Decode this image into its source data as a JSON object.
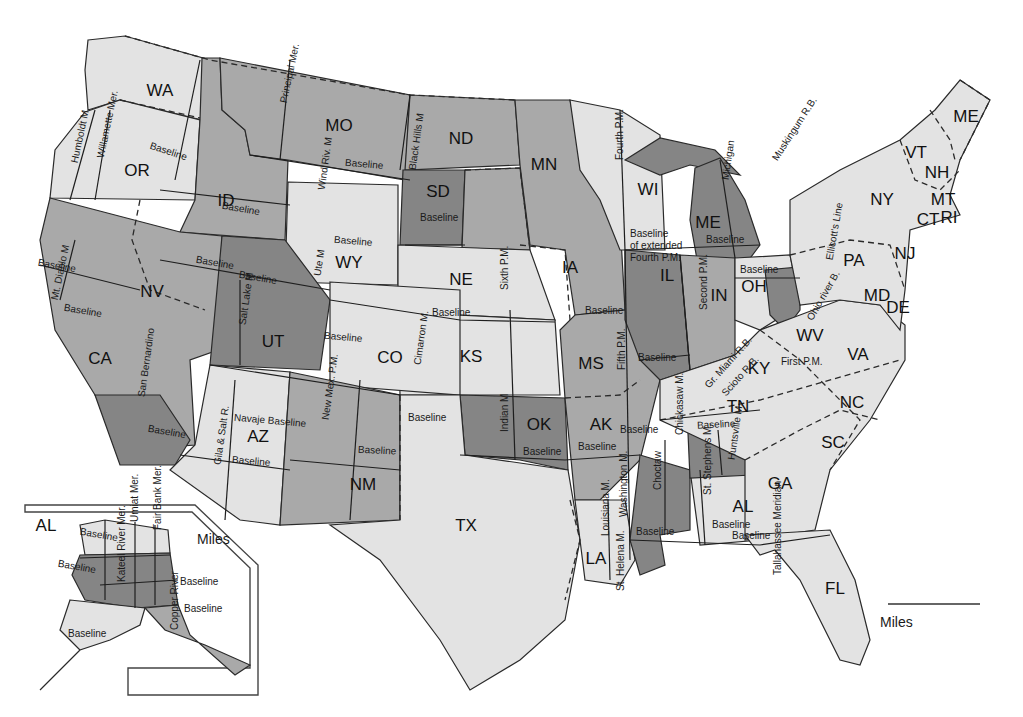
{
  "map": {
    "colors": {
      "background": "#ffffff",
      "light_fill": "#e3e3e3",
      "mid_fill": "#a9a9a9",
      "dark_fill": "#858585",
      "line": "#2a2a2a"
    },
    "states": [
      {
        "abbr": "WA",
        "x": 160,
        "y": 92,
        "shade": "light"
      },
      {
        "abbr": "OR",
        "x": 137,
        "y": 172,
        "shade": "light"
      },
      {
        "abbr": "ID",
        "x": 226,
        "y": 202,
        "shade": "mid"
      },
      {
        "abbr": "MO",
        "x": 339,
        "y": 127,
        "shade": "mid"
      },
      {
        "abbr": "ND",
        "x": 461,
        "y": 140,
        "shade": "mid"
      },
      {
        "abbr": "SD",
        "x": 438,
        "y": 193,
        "shade": "dark"
      },
      {
        "abbr": "MN",
        "x": 544,
        "y": 166,
        "shade": "mid"
      },
      {
        "abbr": "WY",
        "x": 349,
        "y": 264,
        "shade": "light"
      },
      {
        "abbr": "NE",
        "x": 461,
        "y": 281,
        "shade": "light"
      },
      {
        "abbr": "IA",
        "x": 570,
        "y": 269,
        "shade": "mid"
      },
      {
        "abbr": "WI",
        "x": 648,
        "y": 191,
        "shade": "light"
      },
      {
        "abbr": "ME",
        "x": 708,
        "y": 224,
        "shade": "dark"
      },
      {
        "abbr": "NV",
        "x": 152,
        "y": 293,
        "shade": "mid"
      },
      {
        "abbr": "UT",
        "x": 273,
        "y": 343,
        "shade": "dark"
      },
      {
        "abbr": "CO",
        "x": 390,
        "y": 359,
        "shade": "light"
      },
      {
        "abbr": "KS",
        "x": 471,
        "y": 358,
        "shade": "light"
      },
      {
        "abbr": "MS",
        "x": 591,
        "y": 365,
        "shade": "mid"
      },
      {
        "abbr": "IL",
        "x": 667,
        "y": 277,
        "shade": "dark"
      },
      {
        "abbr": "IN",
        "x": 719,
        "y": 297,
        "shade": "mid"
      },
      {
        "abbr": "OH",
        "x": 754,
        "y": 288,
        "shade": "light"
      },
      {
        "abbr": "CA",
        "x": 100,
        "y": 360,
        "shade": "mid"
      },
      {
        "abbr": "AZ",
        "x": 258,
        "y": 438,
        "shade": "light"
      },
      {
        "abbr": "NM",
        "x": 363,
        "y": 486,
        "shade": "mid"
      },
      {
        "abbr": "OK",
        "x": 539,
        "y": 426,
        "shade": "dark"
      },
      {
        "abbr": "AK",
        "x": 601,
        "y": 426,
        "shade": "mid"
      },
      {
        "abbr": "TX",
        "x": 466,
        "y": 527,
        "shade": "light"
      },
      {
        "abbr": "LA",
        "x": 596,
        "y": 560,
        "shade": "light"
      },
      {
        "abbr": "AL",
        "x": 743,
        "y": 508,
        "shade": "light"
      },
      {
        "abbr": "GA",
        "x": 780,
        "y": 485,
        "shade": "light"
      },
      {
        "abbr": "FL",
        "x": 835,
        "y": 590,
        "shade": "light"
      },
      {
        "abbr": "TN",
        "x": 738,
        "y": 408,
        "shade": "light"
      },
      {
        "abbr": "KY",
        "x": 759,
        "y": 370,
        "shade": "light"
      },
      {
        "abbr": "WV",
        "x": 810,
        "y": 337,
        "shade": "light"
      },
      {
        "abbr": "VA",
        "x": 858,
        "y": 356,
        "shade": "light"
      },
      {
        "abbr": "NC",
        "x": 852,
        "y": 404,
        "shade": "light"
      },
      {
        "abbr": "SC",
        "x": 833,
        "y": 444,
        "shade": "light"
      },
      {
        "abbr": "PA",
        "x": 854,
        "y": 262,
        "shade": "light"
      },
      {
        "abbr": "NY",
        "x": 882,
        "y": 201,
        "shade": "light"
      },
      {
        "abbr": "NJ",
        "x": 905,
        "y": 255,
        "shade": "light"
      },
      {
        "abbr": "MD",
        "x": 877,
        "y": 297,
        "shade": "light"
      },
      {
        "abbr": "DE",
        "x": 898,
        "y": 309,
        "shade": "light"
      },
      {
        "abbr": "VT",
        "x": 916,
        "y": 154,
        "shade": "light"
      },
      {
        "abbr": "NH",
        "x": 937,
        "y": 174,
        "shade": "light"
      },
      {
        "abbr": "ME",
        "x": 966,
        "y": 118,
        "shade": "light"
      },
      {
        "abbr": "MT",
        "x": 943,
        "y": 201,
        "shade": "light"
      },
      {
        "abbr": "CT",
        "x": 928,
        "y": 221,
        "shade": "light"
      },
      {
        "abbr": "RI",
        "x": 949,
        "y": 219,
        "shade": "light"
      },
      {
        "abbr": "AL",
        "x": 46,
        "y": 527,
        "shade": "light"
      }
    ],
    "meridians": [
      {
        "label": "Humboldt M",
        "x": 75,
        "y": 163,
        "rotate": -78
      },
      {
        "label": "Willamette Mer.",
        "x": 101,
        "y": 158,
        "rotate": -78
      },
      {
        "label": "Principal Mer.",
        "x": 284,
        "y": 103,
        "rotate": -78
      },
      {
        "label": "Wind Riv. M",
        "x": 322,
        "y": 190,
        "rotate": -82
      },
      {
        "label": "Black Hills M",
        "x": 413,
        "y": 170,
        "rotate": -82
      },
      {
        "label": "Mt. Diablo M",
        "x": 55,
        "y": 300,
        "rotate": -78
      },
      {
        "label": "Salt Lake M",
        "x": 243,
        "y": 325,
        "rotate": -82
      },
      {
        "label": "Ute M",
        "x": 318,
        "y": 276,
        "rotate": -82
      },
      {
        "label": "Cimarron M.",
        "x": 418,
        "y": 365,
        "rotate": -82
      },
      {
        "label": "Sixth P.M.",
        "x": 505,
        "y": 290,
        "rotate": -90
      },
      {
        "label": "New Mex. P.M.",
        "x": 326,
        "y": 420,
        "rotate": -82
      },
      {
        "label": "San Bernardino",
        "x": 142,
        "y": 397,
        "rotate": -82
      },
      {
        "label": "Gila & Salt R.",
        "x": 218,
        "y": 465,
        "rotate": -82
      },
      {
        "label": "Indian M",
        "x": 505,
        "y": 432,
        "rotate": -90
      },
      {
        "label": "Fifth P.M.",
        "x": 622,
        "y": 370,
        "rotate": -90
      },
      {
        "label": "Fourth P.M.",
        "x": 620,
        "y": 160,
        "rotate": -90
      },
      {
        "label": "Michigan",
        "x": 726,
        "y": 180,
        "rotate": -82
      },
      {
        "label": "Second P.M.",
        "x": 704,
        "y": 310,
        "rotate": -90
      },
      {
        "label": "Muskingum R.B.",
        "x": 775,
        "y": 160,
        "rotate": -57
      },
      {
        "label": "Ellicott's Line",
        "x": 830,
        "y": 260,
        "rotate": -80
      },
      {
        "label": "Ohio river B.",
        "x": 810,
        "y": 320,
        "rotate": -60
      },
      {
        "label": "First P.M.",
        "x": 781,
        "y": 362,
        "rotate": 0
      },
      {
        "label": "Gr. Miami R.B.",
        "x": 707,
        "y": 387,
        "rotate": -48
      },
      {
        "label": "Scioto R.B.",
        "x": 724,
        "y": 395,
        "rotate": -48
      },
      {
        "label": "Chickasaw M.",
        "x": 680,
        "y": 435,
        "rotate": -90
      },
      {
        "label": "Choctaw",
        "x": 658,
        "y": 490,
        "rotate": -90
      },
      {
        "label": "St. Stephens M.",
        "x": 708,
        "y": 495,
        "rotate": -90
      },
      {
        "label": "Huntsville M.",
        "x": 732,
        "y": 460,
        "rotate": -82
      },
      {
        "label": "Louisiana M.",
        "x": 606,
        "y": 536,
        "rotate": -90
      },
      {
        "label": "Washington M.",
        "x": 624,
        "y": 517,
        "rotate": -90
      },
      {
        "label": "St. Helena M.",
        "x": 621,
        "y": 591,
        "rotate": -90
      },
      {
        "label": "Tallahassee Meridian",
        "x": 778,
        "y": 575,
        "rotate": -90
      },
      {
        "label": "Umiat Mer.",
        "x": 135,
        "y": 522,
        "rotate": -90
      },
      {
        "label": "Fair Bank Mer.",
        "x": 158,
        "y": 530,
        "rotate": -90
      },
      {
        "label": "Kateel River Mer.",
        "x": 122,
        "y": 582,
        "rotate": -90
      },
      {
        "label": "Copper River",
        "x": 175,
        "y": 630,
        "rotate": -90
      }
    ],
    "baselines": [
      {
        "label": "Baseline",
        "x": 150,
        "y": 146,
        "rotate": 18
      },
      {
        "label": "Baseline",
        "x": 222,
        "y": 206,
        "rotate": 10
      },
      {
        "label": "Baseline",
        "x": 345,
        "y": 163,
        "rotate": 5
      },
      {
        "label": "Baseline",
        "x": 420,
        "y": 218,
        "rotate": 0
      },
      {
        "label": "Baseline",
        "x": 334,
        "y": 240,
        "rotate": 5
      },
      {
        "label": "Baseline",
        "x": 196,
        "y": 260,
        "rotate": 10
      },
      {
        "label": "Baseline",
        "x": 239,
        "y": 275,
        "rotate": 10
      },
      {
        "label": "Baseline",
        "x": 38,
        "y": 263,
        "rotate": 10
      },
      {
        "label": "Baseline",
        "x": 64,
        "y": 308,
        "rotate": 10
      },
      {
        "label": "Baseline",
        "x": 324,
        "y": 336,
        "rotate": 5
      },
      {
        "label": "Baseline",
        "x": 432,
        "y": 313,
        "rotate": 0
      },
      {
        "label": "Baseline",
        "x": 408,
        "y": 418,
        "rotate": 0
      },
      {
        "label": "Baseline",
        "x": 148,
        "y": 429,
        "rotate": 10
      },
      {
        "label": "Navaje Baseline",
        "x": 234,
        "y": 418,
        "rotate": 5
      },
      {
        "label": "Baseline",
        "x": 232,
        "y": 460,
        "rotate": 5
      },
      {
        "label": "Baseline",
        "x": 358,
        "y": 450,
        "rotate": 3
      },
      {
        "label": "Baseline",
        "x": 523,
        "y": 452,
        "rotate": 0
      },
      {
        "label": "Baseline",
        "x": 578,
        "y": 447,
        "rotate": 0
      },
      {
        "label": "Baseline",
        "x": 620,
        "y": 430,
        "rotate": 0
      },
      {
        "label": "Baseline",
        "x": 585,
        "y": 311,
        "rotate": 0
      },
      {
        "label": "Baseline",
        "x": 638,
        "y": 358,
        "rotate": 0
      },
      {
        "label": "Baseline",
        "x": 706,
        "y": 240,
        "rotate": 0
      },
      {
        "label": "Baseline",
        "x": 740,
        "y": 270,
        "rotate": 0
      },
      {
        "label": "Baseline",
        "x": 697,
        "y": 426,
        "rotate": -3
      },
      {
        "label": "Baseline",
        "x": 636,
        "y": 532,
        "rotate": 0
      },
      {
        "label": "Baseline",
        "x": 712,
        "y": 525,
        "rotate": 0
      },
      {
        "label": "Baseline",
        "x": 732,
        "y": 536,
        "rotate": 0
      },
      {
        "label": "Baseline",
        "x": 80,
        "y": 532,
        "rotate": 10
      },
      {
        "label": "Baseline",
        "x": 58,
        "y": 564,
        "rotate": 10
      },
      {
        "label": "Baseline",
        "x": 180,
        "y": 582,
        "rotate": 0
      },
      {
        "label": "Baseline",
        "x": 184,
        "y": 609,
        "rotate": 0
      },
      {
        "label": "Baseline",
        "x": 68,
        "y": 634,
        "rotate": 0
      }
    ],
    "wisconsin_note": [
      "Baseline",
      "of extended",
      "Fourth P.M."
    ],
    "scale_bars": [
      {
        "label": "Miles",
        "x": 197,
        "y": 544
      },
      {
        "label": "Miles",
        "x": 880,
        "y": 627
      }
    ]
  }
}
